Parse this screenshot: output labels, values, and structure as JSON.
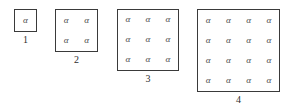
{
  "figure": {
    "symbol": "α",
    "background_color": "#ffffff",
    "border_color": "#3a3a3a",
    "symbol_color": "#4a4a4a",
    "caption_color": "#2e2e2e",
    "groups": [
      {
        "caption": "1",
        "grid_size": 1,
        "cells": [
          "α"
        ]
      },
      {
        "caption": "2",
        "grid_size": 2,
        "cells": [
          "α",
          "α",
          "α",
          "α"
        ]
      },
      {
        "caption": "3",
        "grid_size": 3,
        "cells": [
          "α",
          "α",
          "α",
          "α",
          "α",
          "α",
          "α",
          "α",
          "α"
        ]
      },
      {
        "caption": "4",
        "grid_size": 4,
        "cells": [
          "α",
          "α",
          "α",
          "α",
          "α",
          "α",
          "α",
          "α",
          "α",
          "α",
          "α",
          "α",
          "α",
          "α",
          "α",
          "α"
        ]
      }
    ]
  }
}
